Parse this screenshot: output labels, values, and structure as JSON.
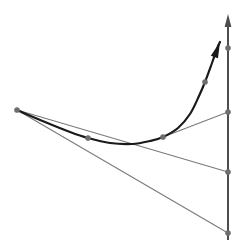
{
  "figure": {
    "canvas": {
      "width": 242,
      "height": 246,
      "background": "#ffffff"
    },
    "colors": {
      "curve": "#1a1a1a",
      "axis": "#4d4d4d",
      "line": "#7a7a7a",
      "node": "#6e6e6e",
      "background": "#ffffff"
    },
    "strokes": {
      "curve_width": 2.2,
      "axis_width": 2.0,
      "line_width": 1.1,
      "node_radius": 2.6
    }
  },
  "chart_data": {
    "type": "line",
    "title": "",
    "xlabel": "",
    "ylabel": "",
    "grid": false,
    "legend": null,
    "xlim": [
      0,
      242
    ],
    "ylim": [
      246,
      0
    ],
    "curve": {
      "name": "convex-curve",
      "color": "#1a1a1a",
      "points": [
        [
          17,
          110
        ],
        [
          45,
          122
        ],
        [
          70,
          132
        ],
        [
          88,
          138
        ],
        [
          110,
          143
        ],
        [
          132,
          144
        ],
        [
          150,
          141
        ],
        [
          163,
          137
        ],
        [
          178,
          128
        ],
        [
          190,
          114
        ],
        [
          199,
          96
        ],
        [
          205,
          82
        ],
        [
          212,
          63
        ],
        [
          218,
          46
        ]
      ],
      "arrow_at_end": true,
      "arrow_tip": [
        220,
        42
      ]
    },
    "axis": {
      "name": "vertical-axis",
      "color": "#4d4d4d",
      "x": 228,
      "y_bottom": 240,
      "y_top": 14,
      "arrow_at_top": true
    },
    "segments": [
      {
        "name": "tangent-segment-upper",
        "from": [
          163,
          137
        ],
        "to": [
          228,
          112
        ],
        "color": "#7a7a7a"
      },
      {
        "name": "secant-segment-middle",
        "from": [
          17,
          110
        ],
        "to": [
          228,
          172
        ],
        "color": "#7a7a7a"
      },
      {
        "name": "secant-segment-lower",
        "from": [
          17,
          110
        ],
        "to": [
          228,
          233
        ],
        "color": "#7a7a7a"
      }
    ],
    "nodes": [
      {
        "name": "node-curve-left-endpoint",
        "x": 17,
        "y": 110
      },
      {
        "name": "node-curve-mid-left",
        "x": 88,
        "y": 138
      },
      {
        "name": "node-curve-mid-right",
        "x": 163,
        "y": 137
      },
      {
        "name": "node-curve-upper",
        "x": 205,
        "y": 82
      },
      {
        "name": "node-axis-upper",
        "x": 228,
        "y": 48
      },
      {
        "name": "node-axis-tangent-intercept",
        "x": 228,
        "y": 112
      },
      {
        "name": "node-axis-secant-mid-intercept",
        "x": 228,
        "y": 172
      },
      {
        "name": "node-axis-secant-low-intercept",
        "x": 228,
        "y": 233
      }
    ]
  }
}
